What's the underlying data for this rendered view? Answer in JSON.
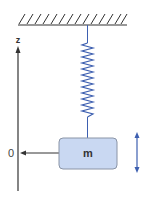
{
  "diagram": {
    "axis": {
      "label": "z",
      "origin_label": "0"
    },
    "mass": {
      "label": "m",
      "fill": "#c9d8f2",
      "stroke": "#8a94a6"
    },
    "spring": {
      "color": "#3d5fb0",
      "coils": 12
    },
    "ceiling": {
      "color": "#333333"
    },
    "motion_arrow": {
      "color": "#3d5fb0",
      "direction": "vertical-bidirectional"
    }
  }
}
